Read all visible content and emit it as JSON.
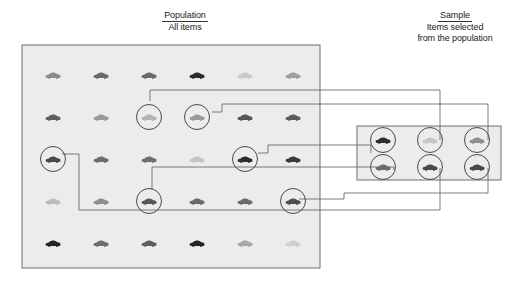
{
  "figure": {
    "type": "diagram",
    "icon_name": "car-icon"
  },
  "population": {
    "title": "Population",
    "subtitle": "All items",
    "box": {
      "x": 22,
      "y": 45,
      "w": 298,
      "h": 223,
      "fill": "#ececec",
      "stroke": "#6f6f6f"
    },
    "grid": {
      "cols": 6,
      "rows": 5,
      "x0": 53,
      "y0": 75,
      "dx": 48,
      "dy": 42
    },
    "items": [
      [
        {
          "col": 0,
          "row": 0,
          "color": "#8b8b8b",
          "selected": false
        },
        {
          "col": 1,
          "row": 0,
          "color": "#6a6a6a",
          "selected": false
        },
        {
          "col": 2,
          "row": 0,
          "color": "#6a6a6a",
          "selected": false
        },
        {
          "col": 3,
          "row": 0,
          "color": "#2b2b2b",
          "selected": false
        },
        {
          "col": 4,
          "row": 0,
          "color": "#c9c9c9",
          "selected": false
        },
        {
          "col": 5,
          "row": 0,
          "color": "#9e9e9e",
          "selected": false
        }
      ],
      [
        {
          "col": 0,
          "row": 1,
          "color": "#5e5e5e",
          "selected": false
        },
        {
          "col": 1,
          "row": 1,
          "color": "#9a9a9a",
          "selected": false
        },
        {
          "col": 2,
          "row": 1,
          "color": "#b4b4b4",
          "selected": true
        },
        {
          "col": 3,
          "row": 1,
          "color": "#9a9a9a",
          "selected": true
        },
        {
          "col": 4,
          "row": 1,
          "color": "#555555",
          "selected": false
        },
        {
          "col": 5,
          "row": 1,
          "color": "#5c5c5c",
          "selected": false
        }
      ],
      [
        {
          "col": 0,
          "row": 2,
          "color": "#4a4a4a",
          "selected": true
        },
        {
          "col": 1,
          "row": 2,
          "color": "#6e6e6e",
          "selected": false
        },
        {
          "col": 2,
          "row": 2,
          "color": "#6e6e6e",
          "selected": false
        },
        {
          "col": 3,
          "row": 2,
          "color": "#c4c4c4",
          "selected": false
        },
        {
          "col": 4,
          "row": 2,
          "color": "#2e2e2e",
          "selected": true
        },
        {
          "col": 5,
          "row": 2,
          "color": "#3a3a3a",
          "selected": false
        }
      ],
      [
        {
          "col": 0,
          "row": 3,
          "color": "#bdbdbd",
          "selected": false
        },
        {
          "col": 1,
          "row": 3,
          "color": "#8e8e8e",
          "selected": false
        },
        {
          "col": 2,
          "row": 3,
          "color": "#585858",
          "selected": true
        },
        {
          "col": 3,
          "row": 3,
          "color": "#6b6b6b",
          "selected": false
        },
        {
          "col": 4,
          "row": 3,
          "color": "#6b6b6b",
          "selected": false
        },
        {
          "col": 5,
          "row": 3,
          "color": "#4e4e4e",
          "selected": true
        }
      ],
      [
        {
          "col": 0,
          "row": 4,
          "color": "#242424",
          "selected": false
        },
        {
          "col": 1,
          "row": 4,
          "color": "#6d6d6d",
          "selected": false
        },
        {
          "col": 2,
          "row": 4,
          "color": "#5f5f5f",
          "selected": false
        },
        {
          "col": 3,
          "row": 4,
          "color": "#262626",
          "selected": false
        },
        {
          "col": 4,
          "row": 4,
          "color": "#a8a8a8",
          "selected": false
        },
        {
          "col": 5,
          "row": 4,
          "color": "#cecece",
          "selected": false
        }
      ]
    ]
  },
  "sample": {
    "title": "Sample",
    "subtitle_line1": "Items selected",
    "subtitle_line2": "from the population",
    "box": {
      "x": 357,
      "y": 126,
      "w": 144,
      "h": 54,
      "fill": "#ececec",
      "stroke": "#6f6f6f"
    },
    "grid": {
      "cols": 3,
      "rows": 2,
      "x0": 383,
      "y0": 140,
      "dx": 47,
      "dy": 27
    },
    "items": [
      {
        "col": 0,
        "row": 0,
        "color": "#2e2e2e"
      },
      {
        "col": 1,
        "row": 0,
        "color": "#c6c6c6"
      },
      {
        "col": 2,
        "row": 0,
        "color": "#8f8f8f"
      },
      {
        "col": 0,
        "row": 1,
        "color": "#6d6d6d"
      },
      {
        "col": 1,
        "row": 1,
        "color": "#4a4a4a"
      },
      {
        "col": 2,
        "row": 1,
        "color": "#4a4a4a"
      }
    ]
  },
  "connectors": {
    "stroke": "#5a5a5a",
    "stroke_width": 0.8,
    "paths": [
      "M 150 101 L 150 90 L 440 90 L 440 140",
      "M 212 112 L 222 112 L 222 104 L 488 104 L 488 140",
      "M 258 153 L 268 153 L 268 145 L 371 145 L 371 153",
      "M 62 154 L 79 154 L 79 210 L 440 210 L 440 168",
      "M 152 190 L 152 167 L 394 167 L 394 170",
      "M 299 199 L 344 199 L 344 193 L 488 193 L 488 168"
    ]
  }
}
